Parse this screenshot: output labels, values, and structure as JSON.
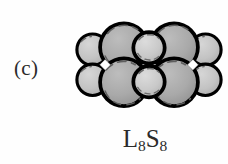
{
  "figure": {
    "panel_label": "(c)",
    "caption": {
      "full_text": "L8S8",
      "symbol_1": "L",
      "subscript_1": "8",
      "symbol_2": "S",
      "subscript_2": "8"
    },
    "background_color": "#fefefe",
    "outline_color": "#000000"
  },
  "diagram": {
    "type": "space-filling-sphere-cluster",
    "colors": {
      "large_sphere_fill": "#a8a8a8",
      "side_sphere_fill": "#c2c2c2",
      "small_sphere_fill": "#c8c8c8",
      "outline": "#000000",
      "highlight_dash": "#5a5a5a",
      "gap_fill": "#ffffff"
    },
    "counts": {
      "large_spheres": 4,
      "side_spheres": 4,
      "center_small_spheres": 2,
      "total_spheres": 10
    },
    "spheres": [
      {
        "name": "side-sphere-top-left",
        "cx": 36,
        "cy": 46,
        "r": 25,
        "layer": "back",
        "fill_key": "side_sphere_fill"
      },
      {
        "name": "side-sphere-top-right",
        "cx": 216,
        "cy": 46,
        "r": 25,
        "layer": "back",
        "fill_key": "side_sphere_fill"
      },
      {
        "name": "side-sphere-bottom-left",
        "cx": 36,
        "cy": 94,
        "r": 25,
        "layer": "back",
        "fill_key": "side_sphere_fill"
      },
      {
        "name": "side-sphere-bottom-right",
        "cx": 216,
        "cy": 94,
        "r": 25,
        "layer": "back",
        "fill_key": "side_sphere_fill"
      },
      {
        "name": "large-sphere-top-left",
        "cx": 86,
        "cy": 42,
        "r": 38,
        "layer": "front",
        "fill_key": "large_sphere_fill"
      },
      {
        "name": "large-sphere-top-right",
        "cx": 166,
        "cy": 42,
        "r": 38,
        "layer": "front",
        "fill_key": "large_sphere_fill"
      },
      {
        "name": "large-sphere-bottom-left",
        "cx": 86,
        "cy": 98,
        "r": 38,
        "layer": "front",
        "fill_key": "large_sphere_fill"
      },
      {
        "name": "large-sphere-bottom-right",
        "cx": 166,
        "cy": 98,
        "r": 38,
        "layer": "front",
        "fill_key": "large_sphere_fill"
      },
      {
        "name": "small-sphere-center-top",
        "cx": 126,
        "cy": 43,
        "r": 25,
        "layer": "top",
        "fill_key": "small_sphere_fill"
      },
      {
        "name": "small-sphere-center-bottom",
        "cx": 126,
        "cy": 97,
        "r": 25,
        "layer": "top",
        "fill_key": "small_sphere_fill"
      }
    ],
    "gaps": [
      {
        "name": "gap-left",
        "cx": 56,
        "cy": 70
      },
      {
        "name": "gap-center",
        "cx": 126,
        "cy": 70
      },
      {
        "name": "gap-right",
        "cx": 196,
        "cy": 70
      }
    ]
  }
}
